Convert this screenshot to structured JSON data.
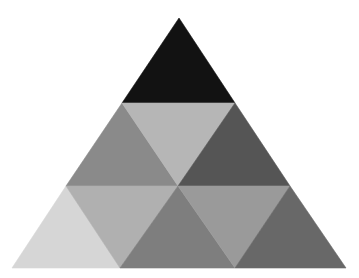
{
  "diagram": {
    "type": "subdivided-triangle",
    "rows": 3,
    "triangles": [
      {
        "id": "t1",
        "row": 1,
        "orientation": "up",
        "points": "179,18 122,103 235,103",
        "fill": "#121212"
      },
      {
        "id": "t2",
        "row": 2,
        "orientation": "up",
        "points": "122,103 66,186 178,186",
        "fill": "#8a8a8a"
      },
      {
        "id": "t3",
        "row": 2,
        "orientation": "down",
        "points": "122,103 235,103 178,186",
        "fill": "#b6b6b6"
      },
      {
        "id": "t4",
        "row": 2,
        "orientation": "up",
        "points": "235,103 178,186 290,186",
        "fill": "#555555"
      },
      {
        "id": "t5",
        "row": 3,
        "orientation": "up",
        "points": "66,186 12,268 120,268",
        "fill": "#d6d6d6"
      },
      {
        "id": "t6",
        "row": 3,
        "orientation": "down",
        "points": "66,186 178,186 120,268",
        "fill": "#b0b0b0"
      },
      {
        "id": "t7",
        "row": 3,
        "orientation": "up",
        "points": "178,186 120,268 235,268",
        "fill": "#7e7e7e"
      },
      {
        "id": "t8",
        "row": 3,
        "orientation": "down",
        "points": "178,186 290,186 235,268",
        "fill": "#9a9a9a"
      },
      {
        "id": "t9",
        "row": 3,
        "orientation": "up",
        "points": "290,186 235,268 346,268",
        "fill": "#686868"
      }
    ]
  }
}
